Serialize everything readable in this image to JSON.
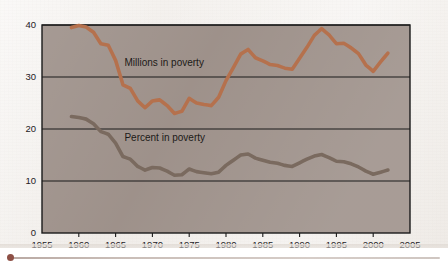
{
  "chart_data": {
    "type": "line",
    "title": "",
    "subtitle": "",
    "xlabel": "",
    "ylabel": "",
    "xlim": [
      1955,
      2005
    ],
    "ylim": [
      0,
      40
    ],
    "xticks": [
      1955,
      1960,
      1965,
      1970,
      1975,
      1980,
      1985,
      1990,
      1995,
      2000,
      2005
    ],
    "yticks": [
      0,
      10,
      20,
      30,
      40
    ],
    "xtick_labels": [
      "1955",
      "1960",
      "1965",
      "1970",
      "1975",
      "1980",
      "1985",
      "1990",
      "1995",
      "2000",
      "2005"
    ],
    "ytick_labels": [
      "0",
      "10",
      "20",
      "30",
      "40"
    ],
    "grid": "horizontal",
    "legend_position": "inline-annotation",
    "plot_background": "#9c8f88",
    "series": [
      {
        "name": "Millions in poverty",
        "color": "#b5714e",
        "annotation": "Millions in poverty",
        "annotation_x": 1966.2,
        "annotation_y": 32.2,
        "x": [
          1959,
          1960,
          1961,
          1962,
          1963,
          1964,
          1965,
          1966,
          1967,
          1968,
          1969,
          1970,
          1971,
          1972,
          1973,
          1974,
          1975,
          1976,
          1977,
          1978,
          1979,
          1980,
          1981,
          1982,
          1983,
          1984,
          1985,
          1986,
          1987,
          1988,
          1989,
          1990,
          1991,
          1992,
          1993,
          1994,
          1995,
          1996,
          1997,
          1998,
          1999,
          2000,
          2001,
          2002
        ],
        "y": [
          39.5,
          39.9,
          39.6,
          38.6,
          36.4,
          36.1,
          33.2,
          28.5,
          27.8,
          25.4,
          24.1,
          25.4,
          25.6,
          24.5,
          23.0,
          23.4,
          25.9,
          25.0,
          24.7,
          24.5,
          26.1,
          29.3,
          31.8,
          34.4,
          35.3,
          33.7,
          33.1,
          32.4,
          32.2,
          31.7,
          31.5,
          33.6,
          35.7,
          38.0,
          39.3,
          38.1,
          36.4,
          36.5,
          35.6,
          34.5,
          32.3,
          31.1,
          32.9,
          34.6
        ]
      },
      {
        "name": "Percent in poverty",
        "color": "#7a6a5e",
        "annotation": "Percent in poverty",
        "annotation_x": 1966.2,
        "annotation_y": 17.6,
        "x": [
          1959,
          1960,
          1961,
          1962,
          1963,
          1964,
          1965,
          1966,
          1967,
          1968,
          1969,
          1970,
          1971,
          1972,
          1973,
          1974,
          1975,
          1976,
          1977,
          1978,
          1979,
          1980,
          1981,
          1982,
          1983,
          1984,
          1985,
          1986,
          1987,
          1988,
          1989,
          1990,
          1991,
          1992,
          1993,
          1994,
          1995,
          1996,
          1997,
          1998,
          1999,
          2000,
          2001,
          2002
        ],
        "y": [
          22.4,
          22.2,
          21.9,
          21.0,
          19.5,
          19.0,
          17.3,
          14.7,
          14.2,
          12.8,
          12.1,
          12.6,
          12.5,
          11.9,
          11.1,
          11.2,
          12.3,
          11.8,
          11.6,
          11.4,
          11.7,
          13.0,
          14.0,
          15.0,
          15.2,
          14.4,
          14.0,
          13.6,
          13.4,
          13.0,
          12.8,
          13.5,
          14.2,
          14.8,
          15.1,
          14.5,
          13.8,
          13.7,
          13.3,
          12.7,
          11.9,
          11.3,
          11.7,
          12.1
        ]
      }
    ]
  },
  "figure": {
    "axis_color": "#1a1a1a",
    "paper_color": "#f2efec"
  }
}
